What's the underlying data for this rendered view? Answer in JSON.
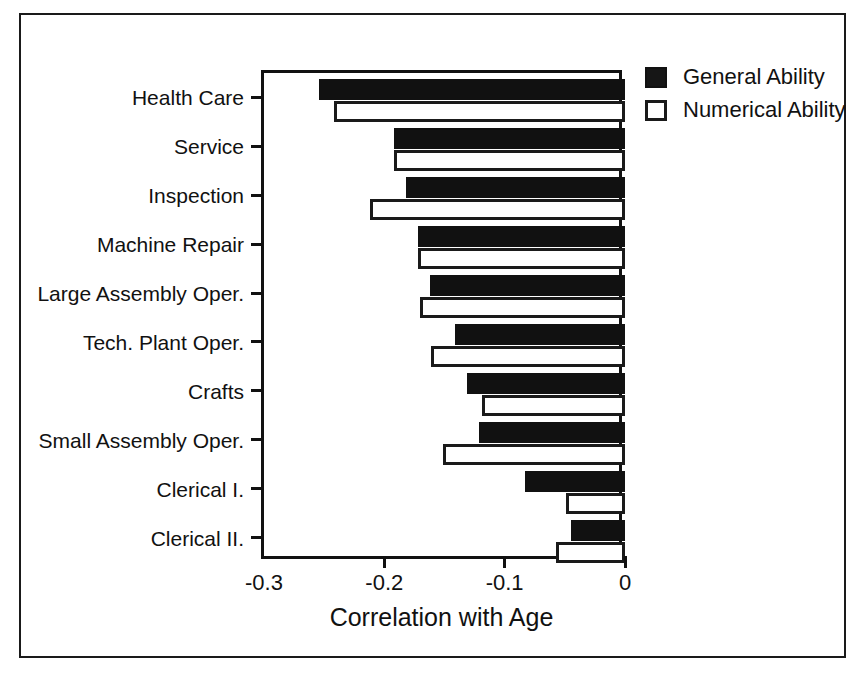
{
  "chart_data": {
    "type": "bar",
    "orientation": "horizontal",
    "title": "",
    "xlabel": "Correlation with Age",
    "ylabel": "",
    "xlim": [
      -0.3,
      0
    ],
    "xticks": [
      -0.3,
      -0.2,
      -0.1,
      0
    ],
    "xtick_labels": [
      "-0.3",
      "-0.2",
      "-0.1",
      "0"
    ],
    "grid": false,
    "legend_position": "top-right",
    "categories": [
      "Health Care",
      "Service",
      "Inspection",
      "Machine Repair",
      "Large Assembly Oper.",
      "Tech. Plant Oper.",
      "Crafts",
      "Small Assembly Oper.",
      "Clerical I.",
      "Clerical II."
    ],
    "series": [
      {
        "name": "General Ability",
        "color": "#111111",
        "style": "filled",
        "values": [
          -0.254,
          -0.192,
          -0.182,
          -0.172,
          -0.162,
          -0.141,
          -0.131,
          -0.121,
          -0.083,
          -0.045
        ]
      },
      {
        "name": "Numerical Ability",
        "color": "#ffffff",
        "style": "outlined",
        "values": [
          -0.242,
          -0.192,
          -0.212,
          -0.172,
          -0.17,
          -0.161,
          -0.119,
          -0.151,
          -0.049,
          -0.057
        ]
      }
    ]
  },
  "legend": {
    "items": [
      {
        "label": "General Ability",
        "swatch": "filled-black-square"
      },
      {
        "label": "Numerical Ability",
        "swatch": "outlined-white-square"
      }
    ]
  },
  "axis": {
    "x_title": "Correlation with Age"
  },
  "colors": {
    "foreground": "#111111",
    "background": "#ffffff",
    "bar_general": "#111111",
    "bar_numerical": "#ffffff"
  }
}
